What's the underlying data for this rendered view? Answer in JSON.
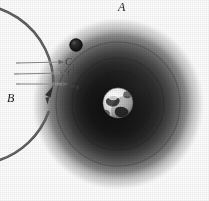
{
  "figure": {
    "background_color": "#ffffff"
  },
  "labels": {
    "orbit_body_label": "A",
    "direction_label": "B",
    "ray_labels": [
      "C",
      "C",
      "C"
    ],
    "ray_subscripts": [
      "1",
      "2",
      "3"
    ]
  },
  "colors": {
    "ring": "#5a5a5a",
    "cloud_outer": "#d8d8d8",
    "cloud_mid": "#5c5c5c",
    "cloud_inner": "#070707",
    "moon": "#1c1c1c",
    "globe_light": "#f4f4f4",
    "globe_dark": "#2a2a2a",
    "ray": "#6e6e6e",
    "text": "#1a1a1a",
    "background": "#ffffff"
  },
  "geometry": {
    "cloud_center": {
      "x": 118,
      "y": 104
    },
    "cloud_radius": 85,
    "ring_center": {
      "x": 118,
      "y": 104
    },
    "ring_radius": 80,
    "ring_stroke_width": 2.4,
    "globe_center": {
      "x": 118,
      "y": 103
    },
    "globe_radius": 15,
    "moon_center": {
      "x": 76,
      "y": 45
    },
    "moon_radius": 6,
    "arrow_tip": {
      "x": 48,
      "y": 104
    },
    "ray_count": 3
  },
  "elements": {
    "cloud_name": "magnetosphere-cloud",
    "ring_name": "orbit-ring",
    "moon_name": "orbiting-body",
    "globe_name": "earth-globe",
    "arrow_name": "orbit-direction-arrow",
    "rays_name": "incoming-rays"
  }
}
